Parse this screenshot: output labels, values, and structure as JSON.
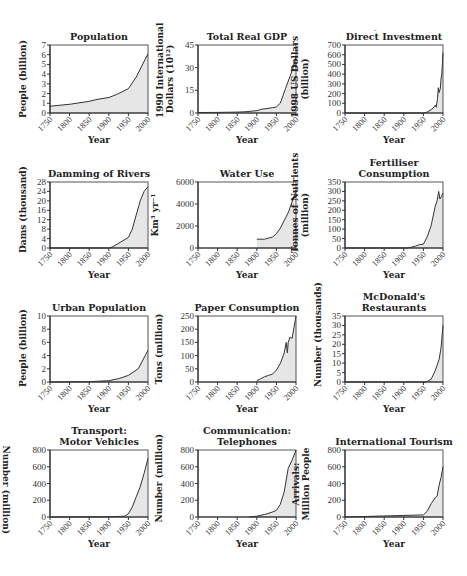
{
  "figure": {
    "x_ticks": [
      "1750",
      "1800",
      "1850",
      "1900",
      "1950",
      "2000"
    ],
    "x_axis_label": "Year",
    "fill_color": "#e6e6e6",
    "line_color": "#333333"
  },
  "chart_data": [
    {
      "type": "area",
      "title": "Population",
      "xlabel": "Year",
      "ylabel": "People (billion)",
      "ylim": [
        0,
        7
      ],
      "yticks": [
        0,
        1,
        2,
        3,
        4,
        5,
        6,
        7
      ],
      "x": [
        1750,
        1800,
        1850,
        1870,
        1900,
        1920,
        1950,
        1970,
        2000
      ],
      "values": [
        0.7,
        0.9,
        1.2,
        1.4,
        1.6,
        1.9,
        2.5,
        3.7,
        6.1
      ]
    },
    {
      "type": "area",
      "title": "Total Real GDP",
      "xlabel": "Year",
      "ylabel": "1990 International Dollars (10^12)",
      "ylim": [
        0,
        45
      ],
      "yticks": [
        0,
        15,
        30,
        45
      ],
      "x": [
        1750,
        1800,
        1850,
        1870,
        1900,
        1913,
        1940,
        1950,
        1960,
        1973,
        1990,
        2000
      ],
      "values": [
        0.3,
        0.4,
        0.6,
        0.8,
        1.5,
        2.5,
        3.5,
        4.0,
        6.5,
        16,
        28,
        37
      ]
    },
    {
      "type": "area",
      "title": "Direct Investment",
      "xlabel": "Year",
      "ylabel": "1998 US Dollars (billion)",
      "ylim": [
        0,
        700
      ],
      "yticks": [
        0,
        100,
        200,
        300,
        400,
        500,
        600,
        700
      ],
      "x": [
        1750,
        1950,
        1960,
        1970,
        1975,
        1980,
        1983,
        1986,
        1988,
        1990,
        1993,
        1995,
        1997,
        2000
      ],
      "values": [
        0,
        0,
        10,
        35,
        50,
        80,
        60,
        150,
        260,
        210,
        250,
        350,
        400,
        620
      ]
    },
    {
      "type": "area",
      "title": "Damming of Rivers",
      "xlabel": "Year",
      "ylabel": "Dams (thousand)",
      "ylim": [
        0,
        28
      ],
      "yticks": [
        0,
        4,
        8,
        12,
        16,
        20,
        24,
        28
      ],
      "x": [
        1750,
        1900,
        1910,
        1930,
        1950,
        1960,
        1970,
        1980,
        1990,
        2000
      ],
      "values": [
        0,
        0,
        0.5,
        2.5,
        4.5,
        8,
        14,
        20,
        24,
        26
      ]
    },
    {
      "type": "area",
      "title": "Water Use",
      "xlabel": "Year",
      "ylabel": "Km³ yr⁻¹",
      "ylim": [
        0,
        6000
      ],
      "yticks": [
        0,
        2000,
        4000,
        6000
      ],
      "x": [
        1900,
        1920,
        1940,
        1950,
        1960,
        1970,
        1980,
        1990,
        2000
      ],
      "values": [
        800,
        800,
        1000,
        1300,
        1800,
        2500,
        3200,
        4200,
        5200
      ]
    },
    {
      "type": "area",
      "title": "Fertiliser Consumption",
      "xlabel": "Year",
      "ylabel": "Tonnes of Nutrients (million)",
      "ylim": [
        0,
        350
      ],
      "yticks": [
        0,
        50,
        100,
        150,
        200,
        250,
        300,
        350
      ],
      "x": [
        1750,
        1910,
        1920,
        1930,
        1940,
        1950,
        1960,
        1970,
        1975,
        1980,
        1985,
        1989,
        1992,
        1995,
        2000
      ],
      "values": [
        0,
        0,
        5,
        10,
        18,
        20,
        60,
        120,
        170,
        220,
        250,
        300,
        260,
        270,
        290
      ]
    },
    {
      "type": "area",
      "title": "Urban Population",
      "xlabel": "Year",
      "ylabel": "People (billion)",
      "ylim": [
        0,
        10
      ],
      "yticks": [
        0,
        2,
        4,
        6,
        8,
        10
      ],
      "x": [
        1750,
        1850,
        1900,
        1925,
        1950,
        1975,
        2000
      ],
      "values": [
        0,
        0.05,
        0.2,
        0.5,
        1.0,
        2.0,
        4.8
      ]
    },
    {
      "type": "area",
      "title": "Paper Consumption",
      "xlabel": "Year",
      "ylabel": "Tons (million)",
      "ylim": [
        0,
        250
      ],
      "yticks": [
        0,
        50,
        100,
        150,
        200,
        250
      ],
      "x": [
        1900,
        1910,
        1920,
        1930,
        1940,
        1950,
        1960,
        1970,
        1975,
        1978,
        1980,
        1985,
        1990,
        2000
      ],
      "values": [
        5,
        12,
        20,
        25,
        30,
        45,
        70,
        110,
        150,
        110,
        150,
        170,
        165,
        250
      ]
    },
    {
      "type": "area",
      "title": "McDonald's Restaurants",
      "xlabel": "Year",
      "ylabel": "Number (thousands)",
      "ylim": [
        0,
        35
      ],
      "yticks": [
        0,
        5,
        10,
        15,
        20,
        25,
        30,
        35
      ],
      "x": [
        1750,
        1955,
        1960,
        1970,
        1980,
        1990,
        1995,
        2000
      ],
      "values": [
        0,
        0,
        0.3,
        1.5,
        6,
        12,
        18,
        30
      ]
    },
    {
      "type": "area",
      "title": "Transport: Motor Vehicles",
      "xlabel": "Year",
      "ylabel": "Number (million)",
      "ylim": [
        0,
        800
      ],
      "yticks": [
        0,
        200,
        400,
        600,
        800
      ],
      "x": [
        1750,
        1900,
        1940,
        1950,
        1960,
        1970,
        1980,
        1990,
        2000
      ],
      "values": [
        0,
        2,
        10,
        40,
        120,
        240,
        360,
        520,
        700
      ]
    },
    {
      "type": "area",
      "title": "Communication: Telephones",
      "xlabel": "Year",
      "ylabel": "Number (million)",
      "ylim": [
        0,
        800
      ],
      "yticks": [
        0,
        200,
        400,
        600,
        800
      ],
      "x": [
        1880,
        1900,
        1920,
        1940,
        1950,
        1960,
        1970,
        1980,
        1990,
        2000
      ],
      "values": [
        0,
        10,
        30,
        60,
        80,
        150,
        300,
        580,
        680,
        800
      ]
    },
    {
      "type": "area",
      "title": "International Tourism",
      "xlabel": "Year",
      "ylabel": "Arrivals: Million People",
      "ylim": [
        0,
        800
      ],
      "yticks": [
        0,
        200,
        400,
        600,
        800
      ],
      "x": [
        1750,
        1950,
        1960,
        1970,
        1980,
        1985,
        1990,
        1995,
        2000
      ],
      "values": [
        0,
        25,
        70,
        160,
        230,
        250,
        380,
        470,
        600
      ]
    }
  ]
}
